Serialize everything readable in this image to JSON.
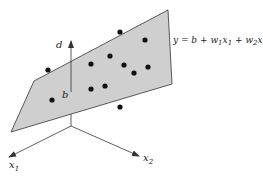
{
  "diagram": {
    "colors": {
      "plane_fill": "#cfcfcf",
      "plane_stroke": "#333333",
      "axis": "#333333",
      "dot": "#111111",
      "background": "#ffffff"
    },
    "plane": {
      "points": "34,81 168,10 172,84 11,132"
    },
    "equation": {
      "y": "y",
      "eq": " = ",
      "b": "b",
      "plus1": " + ",
      "w1": "w",
      "w1_sub": "1",
      "x1": "x",
      "x1_sub": "1",
      "plus2": " + ",
      "w2": "w",
      "w2_sub": "2",
      "x2": "x",
      "x2_sub": "2"
    },
    "labels": {
      "d": "d",
      "b": "b",
      "x1": "x",
      "x1_sub": "1",
      "x2": "x",
      "x2_sub": "2"
    },
    "axes": {
      "origin": [
        71,
        126
      ],
      "x1_tip": [
        9,
        157
      ],
      "x2_tip": [
        139,
        156
      ],
      "d_tip": [
        71,
        41
      ],
      "d_base": [
        71,
        92
      ]
    },
    "points": [
      [
        48,
        70
      ],
      [
        120,
        32
      ],
      [
        145,
        40
      ],
      [
        91,
        64
      ],
      [
        110,
        56
      ],
      [
        124,
        65
      ],
      [
        134,
        73
      ],
      [
        148,
        67
      ],
      [
        91,
        89
      ],
      [
        105,
        86
      ],
      [
        52,
        100
      ],
      [
        120,
        107
      ]
    ]
  }
}
